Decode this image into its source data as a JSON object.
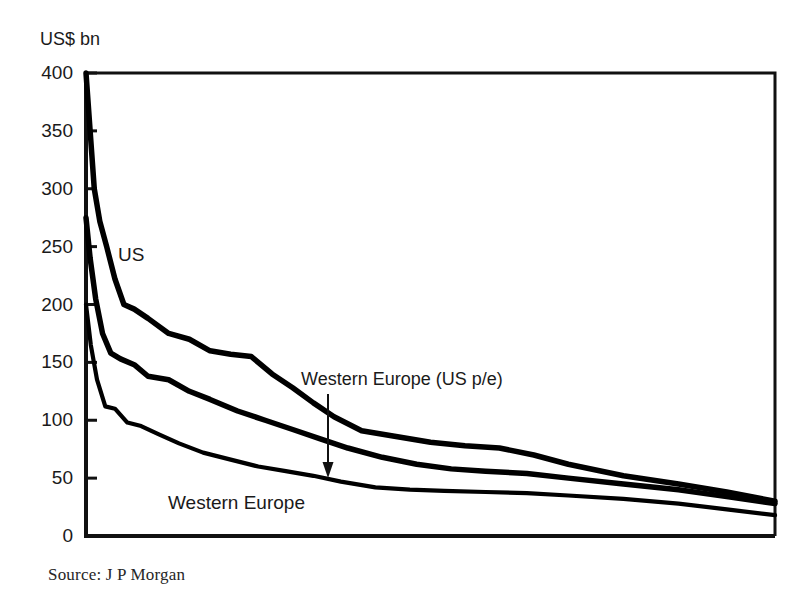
{
  "figure": {
    "axis_unit_label": "US$ bn",
    "source_note": "Source: J P Morgan"
  },
  "annotations": {
    "us_label": "US",
    "western_europe_label": "Western Europe",
    "western_europe_pe_label": "Western Europe (US p/e)"
  },
  "chart_data": {
    "type": "line",
    "title": "",
    "subtitle": "",
    "xlabel": "",
    "ylabel": "US$ bn",
    "ylim": [
      0,
      400
    ],
    "yticks": [
      0,
      50,
      100,
      150,
      200,
      250,
      300,
      350,
      400
    ],
    "ytick_labels": [
      "0",
      "50",
      "100",
      "150",
      "200",
      "250",
      "300",
      "350",
      "400"
    ],
    "xlim": [
      0,
      100
    ],
    "xticks": [],
    "xtick_labels": [],
    "grid": false,
    "legend_position": "inline-annotations",
    "axis_frame": "box",
    "note": "Ranked market-capitalisation curves; x-axis is an unlabelled rank ordering of companies from largest to smallest.",
    "series": [
      {
        "name": "US",
        "label": "US",
        "color": "#000000",
        "x": [
          0.0,
          0.6,
          1.2,
          2.0,
          3.0,
          4.2,
          5.5,
          7.0,
          9.0,
          12.0,
          15.0,
          18.0,
          21.0,
          24.0,
          27.0,
          30.0,
          33.0,
          36.0,
          40.0,
          45.0,
          50.0,
          55.0,
          60.0,
          65.0,
          70.0,
          78.0,
          86.0,
          93.0,
          100.0
        ],
        "y": [
          400,
          350,
          300,
          272,
          250,
          222,
          200,
          196,
          188,
          175,
          170,
          160,
          157,
          155,
          140,
          128,
          115,
          103,
          91,
          86,
          81,
          78,
          76,
          70,
          62,
          52,
          45,
          38,
          30
        ]
      },
      {
        "name": "Western Europe (US p/e)",
        "label": "Western Europe (US p/e)",
        "color": "#000000",
        "x": [
          0.0,
          0.6,
          1.4,
          2.4,
          3.6,
          5.0,
          7.0,
          9.0,
          12.0,
          15.0,
          18.0,
          22.0,
          26.0,
          30.0,
          34.0,
          38.0,
          43.0,
          48.0,
          53.0,
          58.0,
          64.0,
          70.0,
          78.0,
          86.0,
          93.0,
          100.0
        ],
        "y": [
          275,
          240,
          205,
          175,
          158,
          153,
          148,
          138,
          135,
          125,
          118,
          108,
          100,
          92,
          84,
          76,
          68,
          62,
          58,
          56,
          54,
          50,
          45,
          40,
          34,
          28
        ]
      },
      {
        "name": "Western Europe",
        "label": "Western Europe",
        "color": "#000000",
        "x": [
          0.0,
          0.7,
          1.6,
          2.8,
          4.2,
          6.0,
          8.0,
          10.5,
          13.5,
          17.0,
          21.0,
          25.0,
          29.0,
          33.0,
          37.0,
          42.0,
          47.0,
          52.0,
          58.0,
          64.0,
          70.0,
          78.0,
          86.0,
          93.0,
          100.0
        ],
        "y": [
          200,
          165,
          135,
          112,
          110,
          98,
          95,
          88,
          80,
          72,
          66,
          60,
          56,
          52,
          47,
          42,
          40,
          39,
          38,
          37,
          35,
          32,
          28,
          23,
          18
        ]
      }
    ]
  }
}
